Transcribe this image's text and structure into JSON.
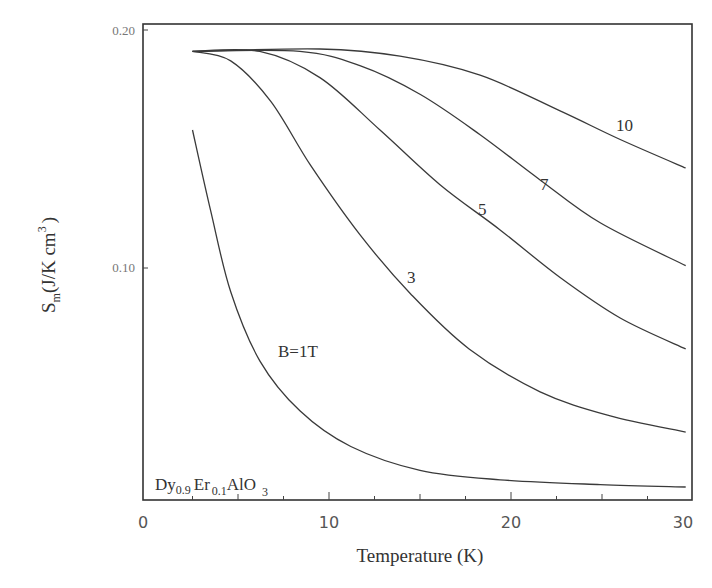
{
  "chart_data": {
    "type": "line",
    "title": "",
    "xlabel": "Temperature (K)",
    "ylabel": "S_m (J/K cm^3)",
    "ylabel_parts": {
      "symbol": "S",
      "subscript": "m",
      "unit": "(J/K cm",
      "sup": "3",
      "close": ")"
    },
    "xlim": [
      0,
      30
    ],
    "ylim": [
      0,
      0.2
    ],
    "x_ticks": [
      0,
      10,
      20,
      30
    ],
    "x_tick_labels": [
      "0",
      "10",
      "20",
      "30"
    ],
    "y_ticks": [
      0.1,
      0.2
    ],
    "y_tick_labels": [
      "0.10",
      "0.20"
    ],
    "grid": false,
    "legend": "inline curve labels",
    "annotation": {
      "formula": "Dy0.9Er0.1AlO3",
      "parts": {
        "a": "Dy",
        "a_sub": "0.9",
        "b": "Er",
        "b_sub": "0.1",
        "c": "AlO",
        "c_sub": "3"
      }
    },
    "series": [
      {
        "name": "B=1T",
        "label": "B=1T",
        "x": [
          2.5,
          3.5,
          4.6,
          6.2,
          8.4,
          11.2,
          15.0,
          19.4,
          24.9,
          29.6
        ],
        "y": [
          0.158,
          0.124,
          0.09,
          0.061,
          0.04,
          0.025,
          0.015,
          0.011,
          0.009,
          0.008
        ]
      },
      {
        "name": "B=3T",
        "label": "3",
        "x": [
          2.5,
          4.6,
          6.8,
          9.0,
          11.7,
          14.5,
          17.7,
          21.6,
          25.4,
          29.6
        ],
        "y": [
          0.191,
          0.187,
          0.17,
          0.143,
          0.114,
          0.089,
          0.066,
          0.048,
          0.038,
          0.031
        ]
      },
      {
        "name": "B=5T",
        "label": "5",
        "x": [
          2.5,
          6.2,
          9.5,
          12.8,
          16.1,
          19.4,
          22.7,
          26.0,
          29.6
        ],
        "y": [
          0.191,
          0.191,
          0.18,
          0.158,
          0.135,
          0.116,
          0.096,
          0.079,
          0.066
        ]
      },
      {
        "name": "B=7T",
        "label": "7",
        "x": [
          2.5,
          8.4,
          11.7,
          15.0,
          18.3,
          21.6,
          24.9,
          29.6
        ],
        "y": [
          0.191,
          0.191,
          0.185,
          0.173,
          0.156,
          0.137,
          0.119,
          0.101
        ]
      },
      {
        "name": "B=10T",
        "label": "10",
        "x": [
          2.5,
          9.5,
          13.9,
          18.3,
          22.7,
          26.0,
          29.6
        ],
        "y": [
          0.191,
          0.192,
          0.189,
          0.181,
          0.166,
          0.154,
          0.142
        ]
      }
    ]
  }
}
